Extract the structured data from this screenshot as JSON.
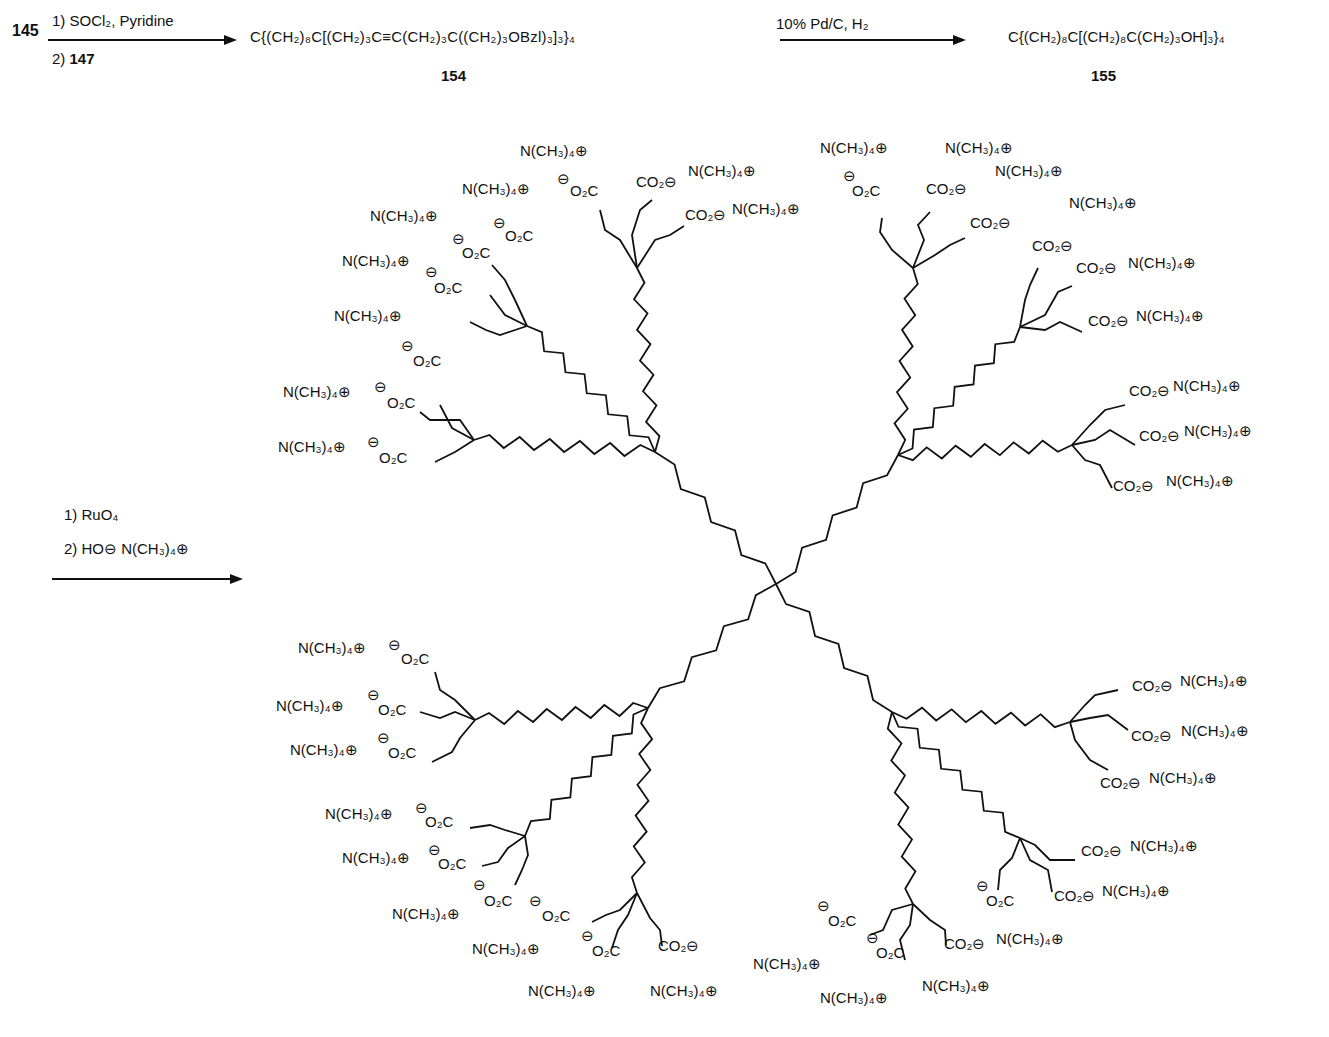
{
  "scheme": {
    "step1": {
      "start_compound": "145",
      "reagent_line1": "1) SOCl₂, Pyridine",
      "reagent_line2_prefix": "2) ",
      "reagent_line2_compound": "147",
      "product_formula": "C{(CH₂)₈C[(CH₂)₃C≡C(CH₂)₃C((CH₂)₃OBzl)₃]₃}₄",
      "product_number": "154"
    },
    "step2": {
      "reagent": "10% Pd/C, H₂",
      "product_formula": "C{(CH₂)₈C[(CH₂)₈C(CH₂)₃OH]₃}₄",
      "product_number": "155"
    },
    "step3": {
      "reagent_line1": "1) RuO₄",
      "reagent_line2": "2) HO⊖ N(CH₃)₄⊕"
    }
  },
  "dendrimer": {
    "description": "Tetradirectional arborol (dendrimer) with 36 terminal carboxylate groups, each paired with a tetramethylammonium counterion",
    "core": "C",
    "terminal_group": "CO₂⊖",
    "terminal_group_left": "⊖O₂C",
    "counterion": "N(CH₃)₄⊕",
    "terminal_count": 36,
    "labels": [
      {
        "t": "N(CH₃)₄⊕",
        "x": 520,
        "y": 155
      },
      {
        "t": "⊖",
        "x": 557,
        "y": 183
      },
      {
        "t": "O₂C",
        "x": 570,
        "y": 195
      },
      {
        "t": "CO₂⊖",
        "x": 636,
        "y": 186
      },
      {
        "t": "N(CH₃)₄⊕",
        "x": 688,
        "y": 175
      },
      {
        "t": "CO₂⊖",
        "x": 685,
        "y": 219
      },
      {
        "t": "N(CH₃)₄⊕",
        "x": 732,
        "y": 213
      },
      {
        "t": "N(CH₃)₄⊕",
        "x": 462,
        "y": 193
      },
      {
        "t": "⊖",
        "x": 493,
        "y": 227
      },
      {
        "t": "O₂C",
        "x": 505,
        "y": 240
      },
      {
        "t": "N(CH₃)₄⊕",
        "x": 370,
        "y": 220
      },
      {
        "t": "⊖",
        "x": 452,
        "y": 243
      },
      {
        "t": "O₂C",
        "x": 462,
        "y": 257
      },
      {
        "t": "N(CH₃)₄⊕",
        "x": 342,
        "y": 265
      },
      {
        "t": "⊖",
        "x": 425,
        "y": 276
      },
      {
        "t": "O₂C",
        "x": 434,
        "y": 292
      },
      {
        "t": "N(CH₃)₄⊕",
        "x": 334,
        "y": 320
      },
      {
        "t": "⊖",
        "x": 401,
        "y": 350
      },
      {
        "t": "O₂C",
        "x": 413,
        "y": 365
      },
      {
        "t": "N(CH₃)₄⊕",
        "x": 283,
        "y": 396
      },
      {
        "t": "⊖",
        "x": 374,
        "y": 391
      },
      {
        "t": "O₂C",
        "x": 387,
        "y": 407
      },
      {
        "t": "N(CH₃)₄⊕",
        "x": 278,
        "y": 451
      },
      {
        "t": "⊖",
        "x": 367,
        "y": 446
      },
      {
        "t": "O₂C",
        "x": 379,
        "y": 462
      },
      {
        "t": "N(CH₃)₄⊕",
        "x": 820,
        "y": 152
      },
      {
        "t": "⊖",
        "x": 843,
        "y": 180
      },
      {
        "t": "O₂C",
        "x": 852,
        "y": 195
      },
      {
        "t": "N(CH₃)₄⊕",
        "x": 945,
        "y": 152
      },
      {
        "t": "CO₂⊖",
        "x": 926,
        "y": 193
      },
      {
        "t": "N(CH₃)₄⊕",
        "x": 995,
        "y": 175
      },
      {
        "t": "CO₂⊖",
        "x": 970,
        "y": 227
      },
      {
        "t": "N(CH₃)₄⊕",
        "x": 1069,
        "y": 207
      },
      {
        "t": "CO₂⊖",
        "x": 1032,
        "y": 250
      },
      {
        "t": "CO₂⊖",
        "x": 1076,
        "y": 272
      },
      {
        "t": "N(CH₃)₄⊕",
        "x": 1128,
        "y": 267
      },
      {
        "t": "CO₂⊖",
        "x": 1088,
        "y": 325
      },
      {
        "t": "N(CH₃)₄⊕",
        "x": 1136,
        "y": 320
      },
      {
        "t": "CO₂⊖",
        "x": 1129,
        "y": 395
      },
      {
        "t": "N(CH₃)₄⊕",
        "x": 1173,
        "y": 390
      },
      {
        "t": "CO₂⊖",
        "x": 1139,
        "y": 440
      },
      {
        "t": "N(CH₃)₄⊕",
        "x": 1184,
        "y": 435
      },
      {
        "t": "CO₂⊖",
        "x": 1113,
        "y": 490
      },
      {
        "t": "N(CH₃)₄⊕",
        "x": 1166,
        "y": 485
      },
      {
        "t": "N(CH₃)₄⊕",
        "x": 298,
        "y": 652
      },
      {
        "t": "⊖",
        "x": 388,
        "y": 649
      },
      {
        "t": "O₂C",
        "x": 401,
        "y": 663
      },
      {
        "t": "N(CH₃)₄⊕",
        "x": 276,
        "y": 710
      },
      {
        "t": "⊖",
        "x": 367,
        "y": 699
      },
      {
        "t": "O₂C",
        "x": 378,
        "y": 714
      },
      {
        "t": "N(CH₃)₄⊕",
        "x": 290,
        "y": 754
      },
      {
        "t": "⊖",
        "x": 377,
        "y": 742
      },
      {
        "t": "O₂C",
        "x": 388,
        "y": 757
      },
      {
        "t": "N(CH₃)₄⊕",
        "x": 325,
        "y": 818
      },
      {
        "t": "⊖",
        "x": 415,
        "y": 812
      },
      {
        "t": "O₂C",
        "x": 425,
        "y": 826
      },
      {
        "t": "N(CH₃)₄⊕",
        "x": 342,
        "y": 862
      },
      {
        "t": "⊖",
        "x": 428,
        "y": 854
      },
      {
        "t": "O₂C",
        "x": 438,
        "y": 868
      },
      {
        "t": "⊖",
        "x": 473,
        "y": 889
      },
      {
        "t": "O₂C",
        "x": 484,
        "y": 905
      },
      {
        "t": "N(CH₃)₄⊕",
        "x": 392,
        "y": 918
      },
      {
        "t": "⊖",
        "x": 529,
        "y": 905
      },
      {
        "t": "O₂C",
        "x": 542,
        "y": 920
      },
      {
        "t": "N(CH₃)₄⊕",
        "x": 472,
        "y": 953
      },
      {
        "t": "⊖",
        "x": 581,
        "y": 940
      },
      {
        "t": "O₂C",
        "x": 592,
        "y": 955
      },
      {
        "t": "CO₂⊖",
        "x": 658,
        "y": 950
      },
      {
        "t": "N(CH₃)₄⊕",
        "x": 528,
        "y": 995
      },
      {
        "t": "N(CH₃)₄⊕",
        "x": 650,
        "y": 995
      },
      {
        "t": "CO₂⊖",
        "x": 1132,
        "y": 690
      },
      {
        "t": "N(CH₃)₄⊕",
        "x": 1180,
        "y": 685
      },
      {
        "t": "CO₂⊖",
        "x": 1131,
        "y": 740
      },
      {
        "t": "N(CH₃)₄⊕",
        "x": 1181,
        "y": 735
      },
      {
        "t": "CO₂⊖",
        "x": 1100,
        "y": 787
      },
      {
        "t": "N(CH₃)₄⊕",
        "x": 1149,
        "y": 782
      },
      {
        "t": "CO₂⊖",
        "x": 1081,
        "y": 855
      },
      {
        "t": "N(CH₃)₄⊕",
        "x": 1130,
        "y": 850
      },
      {
        "t": "CO₂⊖",
        "x": 1054,
        "y": 900
      },
      {
        "t": "N(CH₃)₄⊕",
        "x": 1102,
        "y": 895
      },
      {
        "t": "⊖",
        "x": 976,
        "y": 890
      },
      {
        "t": "O₂C",
        "x": 986,
        "y": 905
      },
      {
        "t": "CO₂⊖",
        "x": 944,
        "y": 948
      },
      {
        "t": "N(CH₃)₄⊕",
        "x": 996,
        "y": 943
      },
      {
        "t": "⊖",
        "x": 817,
        "y": 910
      },
      {
        "t": "O₂C",
        "x": 828,
        "y": 925
      },
      {
        "t": "⊖",
        "x": 866,
        "y": 942
      },
      {
        "t": "O₂C",
        "x": 876,
        "y": 957
      },
      {
        "t": "N(CH₃)₄⊕",
        "x": 753,
        "y": 968
      },
      {
        "t": "N(CH₃)₄⊕",
        "x": 922,
        "y": 990
      },
      {
        "t": "N(CH₃)₄⊕",
        "x": 820,
        "y": 1002
      }
    ]
  }
}
